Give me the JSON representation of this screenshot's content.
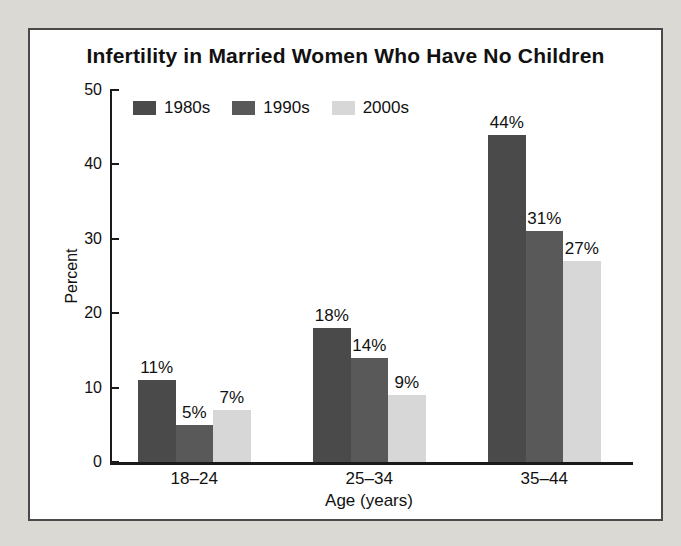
{
  "chart_data": {
    "type": "bar",
    "title": "Infertility in Married Women Who Have No Children",
    "categories": [
      "18–24",
      "25–34",
      "35–44"
    ],
    "series": [
      {
        "name": "1980s",
        "color": "#4a4a4a",
        "values": [
          11,
          18,
          44
        ]
      },
      {
        "name": "1990s",
        "color": "#595959",
        "values": [
          5,
          14,
          31
        ]
      },
      {
        "name": "2000s",
        "color": "#d7d7d7",
        "values": [
          7,
          9,
          27
        ]
      }
    ],
    "data_labels": [
      [
        "11%",
        "18%",
        "44%"
      ],
      [
        "5%",
        "14%",
        "31%"
      ],
      [
        "7%",
        "9%",
        "27%"
      ]
    ],
    "xlabel": "Age (years)",
    "ylabel": "Percent",
    "ylim": [
      0,
      50
    ],
    "yticks": [
      0,
      10,
      20,
      30,
      40,
      50
    ],
    "legend_position": "top-left",
    "grid": false,
    "colors": {
      "page_background": "#dbd9d4",
      "panel_background": "#ffffff",
      "panel_border": "#4a4a4a",
      "axis": "#1a1a1a",
      "text": "#111111"
    }
  }
}
